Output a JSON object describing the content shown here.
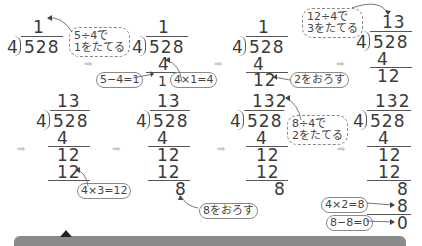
{
  "divisor": "4",
  "dividend": "528",
  "steps": [
    {
      "quotient": "1",
      "rows": [],
      "note": "5÷4で\n1をたてる"
    },
    {
      "quotient": "1",
      "rows": [
        "4",
        "1"
      ],
      "notes": [
        "5−4=1",
        "4×1=4"
      ]
    },
    {
      "quotient": "1",
      "rows": [
        "4",
        "12"
      ],
      "note": "2をおろす"
    },
    {
      "quotient": "13",
      "rows": [
        "4",
        "12"
      ],
      "note": "12÷4で\n3をたてる"
    },
    {
      "quotient": "13",
      "rows": [
        "4",
        "12",
        "12"
      ],
      "note": "4×3=12"
    },
    {
      "quotient": "13",
      "rows": [
        "4",
        "12",
        "12",
        "8"
      ],
      "note": "8をおろす"
    },
    {
      "quotient": "132",
      "rows": [
        "4",
        "12",
        "12",
        "8"
      ],
      "note": "8÷4で\n2をたてる"
    },
    {
      "quotient": "132",
      "rows": [
        "4",
        "12",
        "12",
        "8",
        "8",
        "0"
      ],
      "notes": [
        "4×2=8",
        "8−8=0"
      ]
    }
  ],
  "labels": {
    "s1_note_line1": "5÷4で",
    "s1_note_line2": "1をたてる",
    "s2_sub": "5−4=1",
    "s2_mul": "4×1=4",
    "s3_bring": "2をおろす",
    "s4_note_line1": "12÷4で",
    "s4_note_line2": "3をたてる",
    "s5_mul": "4×3=12",
    "s6_bring": "8をおろす",
    "s7_note_line1": "8÷4で",
    "s7_note_line2": "2をたてる",
    "s8_mul": "4×2=8",
    "s8_sub": "8−8=0"
  },
  "colors": {
    "text": "#3a3a3a",
    "arrow": "#c8c8c8",
    "bar": "#8a8a8a"
  }
}
